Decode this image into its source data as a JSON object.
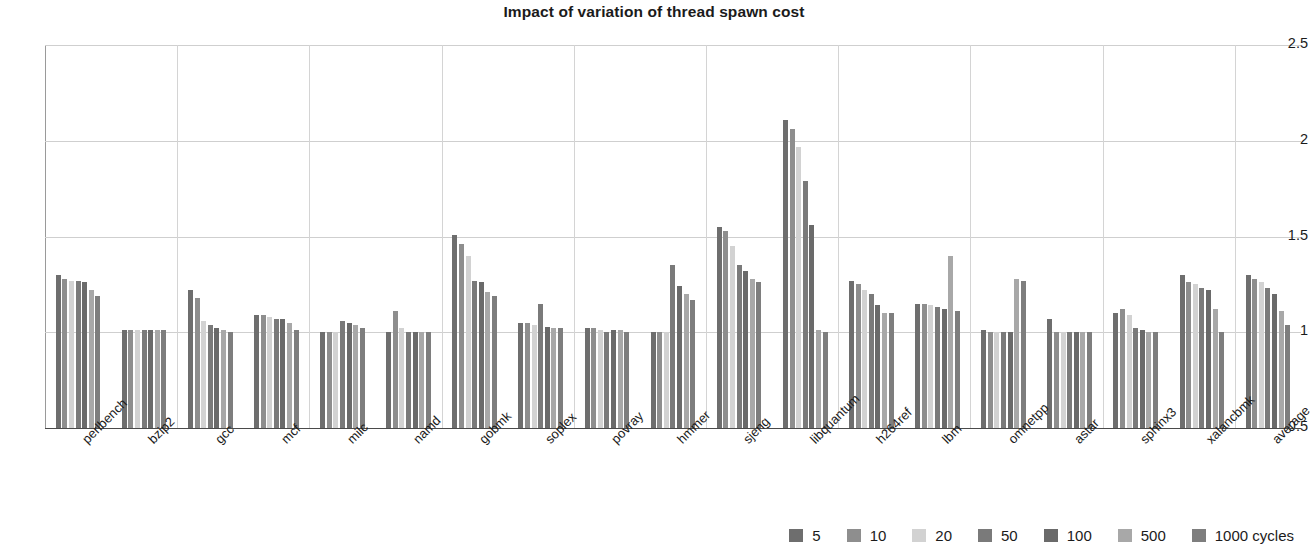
{
  "chart_data": {
    "type": "bar",
    "title": "Impact of variation of thread spawn cost",
    "xlabel": "",
    "ylabel": "",
    "ylim": [
      0.5,
      2.5
    ],
    "yticks": [
      "0.5",
      "1",
      "1.5",
      "2",
      "2.5"
    ],
    "ytick_values": [
      0.5,
      1,
      1.5,
      2,
      2.5
    ],
    "grid": true,
    "legend_position": "bottom-right",
    "categories": [
      "perlbench",
      "bzip2",
      "gcc",
      "mcf",
      "milc",
      "namd",
      "gobmk",
      "soplex",
      "povray",
      "hmmer",
      "sjeng",
      "libquantum",
      "h264ref",
      "lbm",
      "omnetpp",
      "astar",
      "sphinx3",
      "xalancbmk",
      "average"
    ],
    "series": [
      {
        "name": "5",
        "color": "#6e6e6e",
        "values": [
          1.3,
          1.01,
          1.22,
          1.09,
          1.0,
          1.0,
          1.51,
          1.05,
          1.02,
          1.0,
          1.55,
          2.11,
          1.27,
          1.15,
          1.01,
          1.07,
          1.1,
          1.3,
          1.3
        ]
      },
      {
        "name": "10",
        "color": "#8e8e8e",
        "values": [
          1.28,
          1.01,
          1.18,
          1.09,
          1.0,
          1.11,
          1.46,
          1.05,
          1.02,
          1.0,
          1.53,
          2.06,
          1.25,
          1.15,
          1.0,
          1.0,
          1.12,
          1.26,
          1.28
        ]
      },
      {
        "name": "20",
        "color": "#d2d2d2",
        "values": [
          1.27,
          1.01,
          1.06,
          1.08,
          1.0,
          1.02,
          1.4,
          1.04,
          1.01,
          1.0,
          1.45,
          1.97,
          1.22,
          1.14,
          1.0,
          1.0,
          1.09,
          1.25,
          1.26
        ]
      },
      {
        "name": "50",
        "color": "#7a7a7a",
        "values": [
          1.27,
          1.01,
          1.04,
          1.07,
          1.06,
          1.0,
          1.27,
          1.15,
          1.0,
          1.35,
          1.35,
          1.79,
          1.2,
          1.13,
          1.0,
          1.0,
          1.02,
          1.23,
          1.23
        ]
      },
      {
        "name": "100",
        "color": "#6a6a6a",
        "values": [
          1.26,
          1.01,
          1.02,
          1.07,
          1.05,
          1.0,
          1.26,
          1.03,
          1.01,
          1.24,
          1.32,
          1.56,
          1.14,
          1.12,
          1.0,
          1.0,
          1.01,
          1.22,
          1.2
        ]
      },
      {
        "name": "500",
        "color": "#a8a8a8",
        "values": [
          1.22,
          1.01,
          1.01,
          1.05,
          1.04,
          1.0,
          1.21,
          1.02,
          1.01,
          1.2,
          1.28,
          1.01,
          1.1,
          1.4,
          1.28,
          1.0,
          1.0,
          1.12,
          1.11
        ]
      },
      {
        "name": "1000 cycles",
        "color": "#7e7e7e",
        "values": [
          1.19,
          1.01,
          1.0,
          1.01,
          1.02,
          1.0,
          1.19,
          1.02,
          1.0,
          1.17,
          1.26,
          1.0,
          1.1,
          1.11,
          1.27,
          1.0,
          1.0,
          1.0,
          1.04
        ]
      }
    ]
  }
}
